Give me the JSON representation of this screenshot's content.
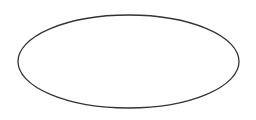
{
  "canvas": {
    "width": 256,
    "height": 120,
    "background": "#ffffff"
  },
  "shapes": [
    {
      "type": "ellipse",
      "cx": 128.5,
      "cy": 61.5,
      "rx": 110.5,
      "ry": 46.5,
      "stroke": "#333333",
      "stroke_width": 1.3,
      "fill": "#ffffff",
      "label": ""
    }
  ]
}
